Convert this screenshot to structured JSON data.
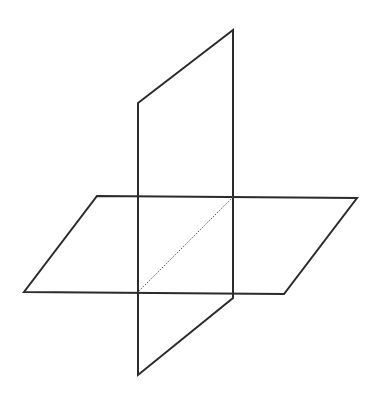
{
  "diagram": {
    "stroke_color": "#2b2b2b",
    "dashed_color": "#555555",
    "background": "#ffffff",
    "horizontal_plane": {
      "points": [
        [
          97,
          196
        ],
        [
          357,
          198
        ],
        [
          284,
          294
        ],
        [
          24,
          292
        ]
      ]
    },
    "vertical_plane": {
      "points": [
        [
          138,
          103
        ],
        [
          233,
          30
        ],
        [
          233,
          298
        ],
        [
          138,
          375
        ]
      ]
    },
    "intersection_line": {
      "from": [
        233,
        197
      ],
      "to": [
        138,
        292
      ],
      "style": "dotted"
    }
  }
}
